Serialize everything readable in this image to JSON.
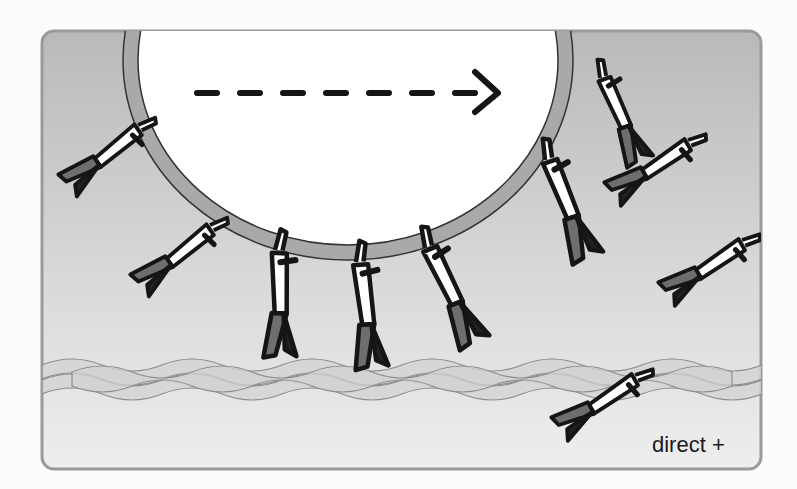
{
  "diagram": {
    "label": "direct +",
    "direction_arrow": {
      "style": "dashed",
      "direction": "right",
      "dash_count": 7
    },
    "colors": {
      "panel_top": "#b9b9b9",
      "panel_bottom": "#ececec",
      "panel_border": "#9a9a9a",
      "vesicle_fill": "#ffffff",
      "vesicle_membrane": "#a9a9a9",
      "outline": "#151515",
      "motor_head": "#6e6e6e",
      "filament_fill": "#d2d2d2",
      "filament_stroke": "#8c8c8c"
    },
    "components": [
      {
        "name": "vesicle",
        "description": "Large membrane-bound cargo vesicle"
      },
      {
        "name": "actin-filament",
        "description": "Braided filament track near the bottom"
      },
      {
        "name": "bound-motors",
        "count": 3,
        "description": "Motors attached to vesicle walking on the filament"
      },
      {
        "name": "vesicle-motors-free",
        "count": 3,
        "description": "Motors attached to vesicle, heads not on filament"
      },
      {
        "name": "free-motors",
        "count": 4,
        "description": "Unattached motors in solution"
      }
    ]
  }
}
